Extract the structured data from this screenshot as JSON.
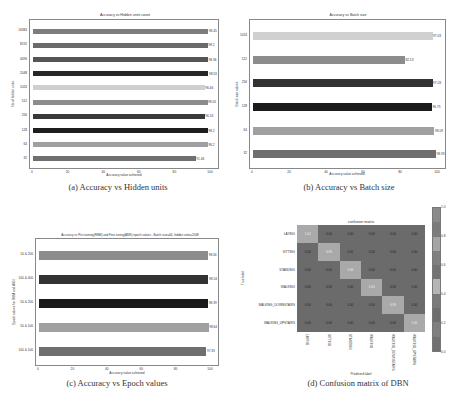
{
  "chart_data": [
    {
      "type": "bar",
      "orientation": "horizontal",
      "title": "Accuracy vs Hidden units count",
      "xlabel": "Accuracy value achieved",
      "ylabel": "No of hidden units",
      "xlim": [
        0,
        100
      ],
      "xticks": [
        "0",
        "20",
        "40",
        "60",
        "80",
        "100"
      ],
      "categories": [
        "32",
        "64",
        "128",
        "256",
        "512",
        "1024",
        "2048",
        "4096",
        "8192",
        "16384"
      ],
      "values": [
        91.46,
        98.2,
        98.2,
        96.53,
        98.05,
        96.46,
        98.53,
        98.36,
        98.2,
        98.45
      ],
      "value_labels": [
        "91.46",
        "98.2",
        "98.2",
        "96.53",
        "98.05",
        "96.46",
        "98.53",
        "98.36",
        "98.2",
        "98.45"
      ],
      "colors": [
        "#6f6f6f",
        "#a0a0a0",
        "#1e1e1e",
        "#3a3a3a",
        "#8c8c8c",
        "#cfcfcf",
        "#262626",
        "#555555",
        "#6a6a6a",
        "#7d7d7d"
      ],
      "caption": "(a) Accuracy vs Hidden units"
    },
    {
      "type": "bar",
      "orientation": "horizontal",
      "title": "Accuracy vs Batch size",
      "xlabel": "Accuracy value achieved",
      "ylabel": "Batch size values",
      "xlim": [
        0,
        100
      ],
      "xticks": [
        "0",
        "20",
        "40",
        "60",
        "80",
        "100"
      ],
      "categories": [
        "32",
        "64",
        "128",
        "256",
        "512",
        "1024"
      ],
      "values": [
        98.93,
        98.09,
        96.75,
        97.03,
        82.13,
        97.03
      ],
      "value_labels": [
        "98.93",
        "98.09",
        "96.75",
        "97.03",
        "82.13",
        "97.03"
      ],
      "colors": [
        "#6f6f6f",
        "#a0a0a0",
        "#1a1a1a",
        "#333333",
        "#8c8c8c",
        "#d0d0d0"
      ],
      "caption": "(b) Accuracy vs Batch size"
    },
    {
      "type": "bar",
      "orientation": "horizontal",
      "title": "Accuracy vs Pre-training(RBM) and Fine-tuning(ANN) epoch values - Batch size=64, hidden units=2048",
      "xlabel": "Accuracy value achieved",
      "ylabel": "Epoch values for RBM and ANN",
      "xlim": [
        0,
        100
      ],
      "xticks": [
        "0",
        "20",
        "40",
        "60",
        "80",
        "100"
      ],
      "categories": [
        "100 & 100",
        "50 & 100",
        "50 & 200",
        "100 & 400",
        "10 & 200"
      ],
      "values": [
        97.33,
        98.64,
        98.39,
        98.54,
        98.34
      ],
      "value_labels": [
        "97.33",
        "98.64",
        "98.39",
        "98.54",
        "98.34"
      ],
      "colors": [
        "#6f6f6f",
        "#a0a0a0",
        "#1a1a1a",
        "#333333",
        "#8c8c8c"
      ],
      "caption": "(c)  Accuracy vs Epoch values"
    },
    {
      "type": "heatmap",
      "title": "confusion matrix",
      "xlabel": "Predicted label",
      "ylabel": "True label",
      "row_labels": [
        "LAYING",
        "SITTING",
        "STANDING",
        "WALKING",
        "WALKING_DOWNSTAIRS",
        "WALKING_UPSTAIRS"
      ],
      "col_labels": [
        "LAYING",
        "SITTING",
        "STANDING",
        "WALKING",
        "WALKING_DOWNSTAIRS",
        "WALKING_UPSTAIRS"
      ],
      "values": [
        [
          1.0,
          0.0,
          0.0,
          0.0,
          0.0,
          0.0
        ],
        [
          0.0,
          0.99,
          0.01,
          0.0,
          0.0,
          0.0
        ],
        [
          0.0,
          0.0,
          1.0,
          0.0,
          0.0,
          0.0
        ],
        [
          0.0,
          0.0,
          0.0,
          1.0,
          0.0,
          0.0
        ],
        [
          0.0,
          0.0,
          0.0,
          0.0,
          0.99,
          0.0
        ],
        [
          0.0,
          0.0,
          0.0,
          0.0,
          0.0,
          1.0
        ]
      ],
      "cell_labels": [
        [
          "1.00",
          "0.00",
          "0.00",
          "0.00",
          "0.00",
          "0.00"
        ],
        [
          "0.00",
          "0.99",
          "0.01",
          "0.00",
          "0.00",
          "0.00"
        ],
        [
          "0.00",
          "0.00",
          "1.00",
          "0.00",
          "0.00",
          "0.00"
        ],
        [
          "0.00",
          "0.00",
          "0.00",
          "1.00",
          "0.00",
          "0.00"
        ],
        [
          "0.00",
          "0.00",
          "0.00",
          "0.00",
          "0.99",
          "0.00"
        ],
        [
          "0.00",
          "0.00",
          "0.00",
          "0.00",
          "0.00",
          "1.00"
        ]
      ],
      "colorbar": {
        "ticks": [
          "1.0",
          "0.8",
          "0.6",
          "0.4",
          "0.2",
          "0.0"
        ],
        "range": [
          0,
          1
        ]
      },
      "caption": "(d)  Confusion matrix of DBN"
    }
  ]
}
